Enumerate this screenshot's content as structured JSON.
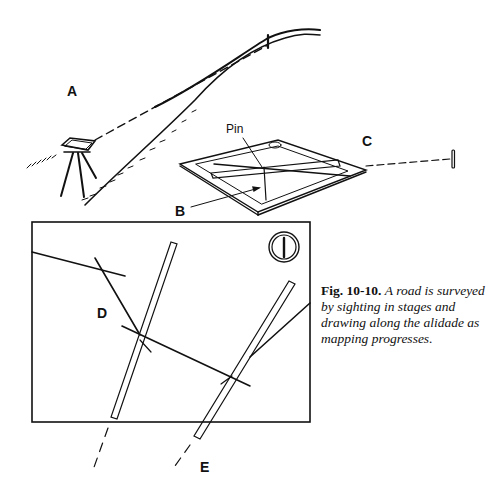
{
  "figure": {
    "labels": {
      "a": "A",
      "b": "B",
      "c": "C",
      "d": "D",
      "e": "E",
      "pin": "Pin"
    },
    "caption": {
      "number": "Fig. 10-10.",
      "text": "A road is surveyed by sighting in stages and drawing along the alidade as mapping progresses."
    },
    "colors": {
      "ink": "#111111",
      "background": "#ffffff"
    }
  }
}
